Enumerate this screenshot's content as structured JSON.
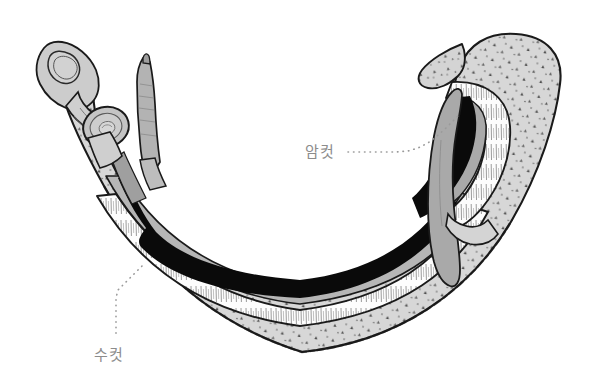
{
  "figure": {
    "kind": "scientific-illustration",
    "background_color": "#ffffff",
    "width": 613,
    "height": 385
  },
  "labels": [
    {
      "id": "female",
      "text": "암컷",
      "color": "#8c8c8c",
      "x": 305,
      "y": 157,
      "leader_color": "#9a9a9a",
      "leader_points": "348,152 360,152 372,152 384,152 396,152 408,151 418,148 428,143 437,136 446,128 454,120 461,113"
    },
    {
      "id": "male",
      "text": "수컷",
      "color": "#8c8c8c",
      "x": 94,
      "y": 360,
      "leader_color": "#9a9a9a",
      "leader_points": "142,266 136,272 130,278 124,284 118,290 116,298 116,306 116,314 116,322 116,330 116,338"
    }
  ],
  "palette": {
    "outline": "#1a1a1a",
    "tegument_gray": "#d7d7d7",
    "tegument_gray_dark": "#c9c9c9",
    "canal_white": "#fdfdfd",
    "inner_gray": "#b6b6b6",
    "female_dark": "#0a0a0a",
    "female_gray": "#a9a9a9",
    "sucker_gray": "#c4c4c4",
    "tubercle": "#4a4a4a",
    "fringe": "#555555"
  },
  "anatomy": {
    "parts": [
      {
        "id": "male-body",
        "name": "male-worm-body",
        "description": "tuberculated gray body curving in a U shape"
      },
      {
        "id": "oral-sucker",
        "name": "oral-sucker",
        "description": "triangular sucker at anterior tip"
      },
      {
        "id": "ventral-sucker",
        "name": "ventral-sucker-acetabulum",
        "description": "round sucker below oral sucker"
      },
      {
        "id": "gynecophoric-canal",
        "name": "gynecophoric-canal",
        "description": "white fringed groove holding the female"
      },
      {
        "id": "female-body",
        "name": "female-worm-body",
        "description": "slender dark worm lying inside the canal"
      },
      {
        "id": "female-anterior",
        "name": "female-anterior-end",
        "description": "gray tapering head protruding near the anterior"
      },
      {
        "id": "female-posterior",
        "name": "female-posterior-end",
        "description": "gray tapering tail protruding at the posterior curve"
      },
      {
        "id": "posterior-flap",
        "name": "posterior-tegument-flap",
        "description": "pointed tegument flap at the upper right"
      }
    ]
  }
}
